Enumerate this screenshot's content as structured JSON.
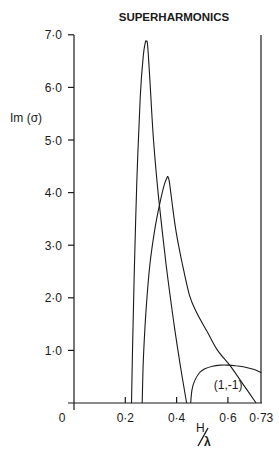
{
  "chart_data": {
    "type": "line",
    "title": "SUPERHARMONICS",
    "xlabel": "H/λ",
    "ylabel": "Im (σ)",
    "xlim": [
      0,
      0.73
    ],
    "ylim": [
      0,
      7.0
    ],
    "grid": false,
    "legend": null,
    "x_ticks": [
      0.2,
      0.4,
      0.6,
      0.73
    ],
    "x_tick_labels": [
      "0·2",
      "0·4",
      "0·6",
      "0·73"
    ],
    "origin_label": "0",
    "y_ticks": [
      1.0,
      2.0,
      3.0,
      4.0,
      5.0,
      6.0,
      7.0
    ],
    "y_tick_labels": [
      "1·0",
      "2·0",
      "3·0",
      "4·0",
      "5·0",
      "6·0",
      "7·0"
    ],
    "series": [
      {
        "name": "branch-1 (tall peak)",
        "x": [
          0.224,
          0.228,
          0.235,
          0.245,
          0.258,
          0.27,
          0.278,
          0.282,
          0.287,
          0.295,
          0.31,
          0.33,
          0.36,
          0.39,
          0.415,
          0.439
        ],
        "y": [
          0.0,
          1.0,
          2.5,
          4.2,
          5.8,
          6.6,
          6.85,
          6.88,
          6.8,
          6.2,
          5.0,
          3.9,
          2.6,
          1.5,
          0.7,
          0.0
        ]
      },
      {
        "name": "branch-2 (second peak)",
        "x": [
          0.266,
          0.27,
          0.28,
          0.295,
          0.315,
          0.335,
          0.352,
          0.362,
          0.366,
          0.372,
          0.385,
          0.4,
          0.42,
          0.45,
          0.48,
          0.52,
          0.56,
          0.61,
          0.66,
          0.71
        ],
        "y": [
          0.0,
          0.8,
          1.7,
          2.6,
          3.3,
          3.8,
          4.15,
          4.28,
          4.3,
          4.2,
          3.7,
          3.2,
          2.7,
          2.05,
          1.7,
          1.35,
          1.0,
          0.7,
          0.35,
          0.0
        ]
      },
      {
        "name": "(1,-1)",
        "x": [
          0.455,
          0.46,
          0.47,
          0.49,
          0.51,
          0.54,
          0.57,
          0.6,
          0.63,
          0.66,
          0.7,
          0.73
        ],
        "y": [
          0.0,
          0.25,
          0.42,
          0.58,
          0.65,
          0.7,
          0.72,
          0.72,
          0.71,
          0.69,
          0.64,
          0.58
        ]
      }
    ],
    "annotations": [
      {
        "text": "(1,-1)",
        "x": 0.545,
        "y": 0.35
      }
    ]
  },
  "labels": {
    "title": "SUPERHARMONICS",
    "ylabel": "Im (σ)",
    "xlabel_num": "H",
    "xlabel_den": "λ",
    "annotation": "(1,-1)"
  }
}
